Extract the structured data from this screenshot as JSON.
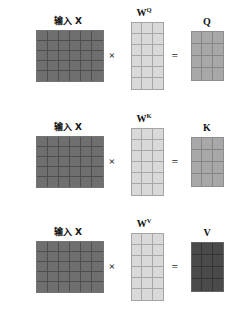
{
  "diagram": {
    "title_text": "Self-attention Q K V projection diagram",
    "rows": [
      {
        "id": "row-q",
        "input_label": "输入 X",
        "weight_label": "W",
        "weight_superscript": "Q",
        "output_label": "Q",
        "multiply_symbol": "×",
        "equals_symbol": "=",
        "input_matrix": {
          "cols": 6,
          "rows": 5,
          "shade": "dark",
          "color": "#6f6f6f"
        },
        "weight_matrix": {
          "cols": 3,
          "rows": 6,
          "shade": "light",
          "color": "#d9d9d9"
        },
        "output_matrix": {
          "cols": 3,
          "rows": 4,
          "shade": "mid",
          "color": "#a8a8a8"
        }
      },
      {
        "id": "row-k",
        "input_label": "输入 X",
        "weight_label": "W",
        "weight_superscript": "K",
        "output_label": "K",
        "multiply_symbol": "×",
        "equals_symbol": "=",
        "input_matrix": {
          "cols": 6,
          "rows": 5,
          "shade": "dark",
          "color": "#6f6f6f"
        },
        "weight_matrix": {
          "cols": 3,
          "rows": 6,
          "shade": "light",
          "color": "#d9d9d9"
        },
        "output_matrix": {
          "cols": 3,
          "rows": 4,
          "shade": "mid",
          "color": "#a8a8a8"
        }
      },
      {
        "id": "row-v",
        "input_label": "输入 X",
        "weight_label": "W",
        "weight_superscript": "V",
        "output_label": "V",
        "multiply_symbol": "×",
        "equals_symbol": "=",
        "input_matrix": {
          "cols": 6,
          "rows": 5,
          "shade": "dark",
          "color": "#6f6f6f"
        },
        "weight_matrix": {
          "cols": 3,
          "rows": 6,
          "shade": "light",
          "color": "#d9d9d9"
        },
        "output_matrix": {
          "cols": 3,
          "rows": 4,
          "shade": "vdark",
          "color": "#4a4a4a"
        }
      }
    ],
    "colors": {
      "background": "#ffffff",
      "text": "#121212",
      "input_fill": "#6f6f6f",
      "weight_fill": "#d9d9d9",
      "qk_fill": "#a8a8a8",
      "v_fill": "#4a4a4a"
    }
  }
}
